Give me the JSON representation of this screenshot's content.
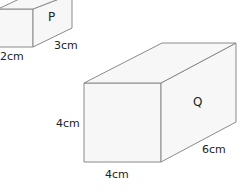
{
  "diagram": {
    "type": "cuboids",
    "shapes": [
      {
        "name": "P",
        "dimensions": {
          "height": "",
          "width": "2cm",
          "depth": "3cm"
        },
        "labels": {
          "width": "2cm",
          "depth": "3cm"
        }
      },
      {
        "name": "Q",
        "dimensions": {
          "height": "4cm",
          "width": "4cm",
          "depth": "6cm"
        },
        "labels": {
          "height": "4cm",
          "width": "4cm",
          "depth": "6cm"
        }
      }
    ]
  }
}
